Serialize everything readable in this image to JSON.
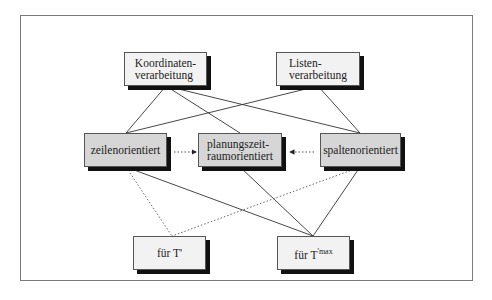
{
  "diagram": {
    "top_row": [
      {
        "id": "koordinaten",
        "line1": "Koordinaten-",
        "line2": "verarbeitung"
      },
      {
        "id": "listen",
        "line1": "Listen-",
        "line2": "verarbeitung"
      }
    ],
    "middle_row": [
      {
        "id": "zeilen",
        "label": "zeilenorientiert"
      },
      {
        "id": "planung",
        "line1": "planungszeit-",
        "line2": "raumorientiert"
      },
      {
        "id": "spalten",
        "label": "spaltenorientiert"
      }
    ],
    "bottom_row": [
      {
        "id": "t1",
        "label": "für T'"
      },
      {
        "id": "tmax",
        "label_base": "für T",
        "label_sup": "'max"
      }
    ],
    "edges": {
      "solid": [
        [
          "koordinaten",
          "zeilen"
        ],
        [
          "koordinaten",
          "planung"
        ],
        [
          "koordinaten",
          "spalten"
        ],
        [
          "listen",
          "zeilen"
        ],
        [
          "listen",
          "spalten"
        ],
        [
          "zeilen",
          "tmax"
        ],
        [
          "planung",
          "tmax"
        ],
        [
          "spalten",
          "tmax"
        ]
      ],
      "dotted": [
        [
          "zeilen",
          "t1"
        ],
        [
          "spalten",
          "t1"
        ]
      ],
      "dotted_arrows": [
        [
          "zeilen",
          "planung"
        ],
        [
          "spalten",
          "planung"
        ]
      ]
    },
    "colors": {
      "frame": "#7a7a7a",
      "box_light": "#f2f2f2",
      "box_gray": "#d6d6d6",
      "shadow": "#111111",
      "line": "#333333"
    }
  }
}
